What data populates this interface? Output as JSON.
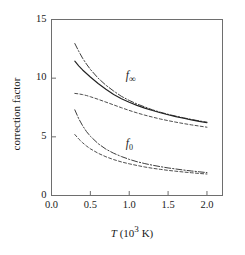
{
  "chart_data": {
    "type": "line",
    "title": "",
    "xlabel": "T (10^3 K)",
    "ylabel": "correction factor",
    "xlim": [
      0.0,
      2.2
    ],
    "ylim": [
      0,
      15
    ],
    "grid": false,
    "legend": "none",
    "x_ticks": [
      "0.0",
      "0.5",
      "1.0",
      "1.5",
      "2.0"
    ],
    "x_tick_values": [
      0.0,
      0.5,
      1.0,
      1.5,
      2.0
    ],
    "y_ticks": [
      "0",
      "5",
      "10",
      "15"
    ],
    "y_tick_values": [
      0,
      5,
      10,
      15
    ],
    "annotations": [
      {
        "text_main": "f",
        "text_sub": "∞",
        "x": 1.02,
        "y": 10.1
      },
      {
        "text_main": "f",
        "text_sub": "0",
        "x": 1.02,
        "y": 4.3
      }
    ],
    "series": [
      {
        "name": "f_inf_dashdot",
        "group": "f_inf",
        "style": "dashdot",
        "color": "#333333",
        "x": [
          0.3,
          0.35,
          0.4,
          0.45,
          0.5,
          0.6,
          0.7,
          0.8,
          0.9,
          1.0,
          1.1,
          1.2,
          1.3,
          1.4,
          1.5,
          1.6,
          1.7,
          1.8,
          1.9,
          2.0
        ],
        "y": [
          12.95,
          12.3,
          11.7,
          11.2,
          10.75,
          10.0,
          9.4,
          8.9,
          8.45,
          8.1,
          7.8,
          7.55,
          7.3,
          7.1,
          6.92,
          6.76,
          6.62,
          6.48,
          6.36,
          6.25
        ]
      },
      {
        "name": "f_inf_solid",
        "group": "f_inf",
        "style": "solid",
        "color": "#222222",
        "x": [
          0.3,
          0.35,
          0.4,
          0.45,
          0.5,
          0.6,
          0.7,
          0.8,
          0.9,
          1.0,
          1.1,
          1.2,
          1.3,
          1.4,
          1.5,
          1.6,
          1.7,
          1.8,
          1.9,
          2.0
        ],
        "y": [
          11.45,
          11.05,
          10.7,
          10.4,
          10.1,
          9.55,
          9.05,
          8.6,
          8.25,
          7.95,
          7.68,
          7.45,
          7.24,
          7.05,
          6.88,
          6.72,
          6.58,
          6.45,
          6.32,
          6.2
        ]
      },
      {
        "name": "f_inf_dashed",
        "group": "f_inf",
        "style": "dashed",
        "color": "#444444",
        "x": [
          0.3,
          0.35,
          0.4,
          0.45,
          0.5,
          0.6,
          0.7,
          0.8,
          0.9,
          1.0,
          1.1,
          1.2,
          1.3,
          1.4,
          1.5,
          1.6,
          1.7,
          1.8,
          1.9,
          2.0
        ],
        "y": [
          8.7,
          8.66,
          8.6,
          8.52,
          8.42,
          8.2,
          7.96,
          7.72,
          7.48,
          7.25,
          7.04,
          6.85,
          6.68,
          6.52,
          6.38,
          6.25,
          6.13,
          6.02,
          5.92,
          5.82
        ]
      },
      {
        "name": "f_0_dashdot",
        "group": "f_0",
        "style": "dashdot",
        "color": "#333333",
        "x": [
          0.3,
          0.35,
          0.4,
          0.45,
          0.5,
          0.6,
          0.7,
          0.8,
          0.9,
          1.0,
          1.1,
          1.2,
          1.3,
          1.4,
          1.5,
          1.6,
          1.7,
          1.8,
          1.9,
          2.0
        ],
        "y": [
          7.3,
          6.55,
          5.95,
          5.45,
          5.05,
          4.42,
          3.95,
          3.6,
          3.32,
          3.08,
          2.88,
          2.72,
          2.58,
          2.46,
          2.35,
          2.26,
          2.17,
          2.09,
          2.02,
          1.95
        ]
      },
      {
        "name": "f_0_dashed",
        "group": "f_0",
        "style": "dashed",
        "color": "#444444",
        "x": [
          0.3,
          0.35,
          0.4,
          0.45,
          0.5,
          0.6,
          0.7,
          0.8,
          0.9,
          1.0,
          1.1,
          1.2,
          1.3,
          1.4,
          1.5,
          1.6,
          1.7,
          1.8,
          1.9,
          2.0
        ],
        "y": [
          5.2,
          4.82,
          4.5,
          4.22,
          3.98,
          3.6,
          3.3,
          3.06,
          2.86,
          2.7,
          2.56,
          2.43,
          2.32,
          2.23,
          2.14,
          2.07,
          2.0,
          1.94,
          1.88,
          1.83
        ]
      }
    ]
  }
}
